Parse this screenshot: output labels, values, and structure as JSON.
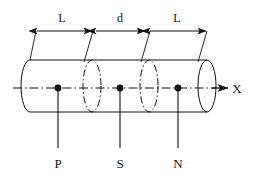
{
  "figure": {
    "background_color": "#ffffff",
    "line_color": "#111111",
    "dimensions": {
      "segments": [
        {
          "id": "left-span",
          "label": "L",
          "label_x": 62,
          "label_y": 22,
          "x_start": 36,
          "x_end": 92
        },
        {
          "id": "middle-span",
          "label": "d",
          "label_x": 120,
          "label_y": 22,
          "x_start": 95,
          "x_end": 146
        },
        {
          "id": "right-span",
          "label": "L",
          "label_x": 177,
          "label_y": 22,
          "x_start": 149,
          "x_end": 207
        }
      ],
      "line_y": 31
    },
    "axis": {
      "label": "X",
      "label_x": 237,
      "label_y": 92,
      "line_y": 88,
      "x_start": 13,
      "x_end": 228
    },
    "nodes": [
      {
        "id": "node-p",
        "label": "P",
        "dot_x": 58,
        "dot_y": 88,
        "label_x": 58,
        "label_y": 167,
        "leader_y_end": 148
      },
      {
        "id": "node-s",
        "label": "S",
        "dot_x": 120,
        "dot_y": 88,
        "label_x": 120,
        "label_y": 167,
        "leader_y_end": 148
      },
      {
        "id": "node-n",
        "label": "N",
        "dot_x": 178,
        "dot_y": 88,
        "label_x": 178,
        "label_y": 167,
        "leader_y_end": 148
      }
    ],
    "cylinder": {
      "top_edge_y": 58,
      "bottom_edge_y": 110,
      "left_x": 30,
      "right_x": 207,
      "cap_rx": 9,
      "cap_ry": 26,
      "cross_sections": [
        {
          "id": "cross-section-1",
          "center_x": 92
        },
        {
          "id": "cross-section-2",
          "center_x": 149
        }
      ]
    }
  }
}
